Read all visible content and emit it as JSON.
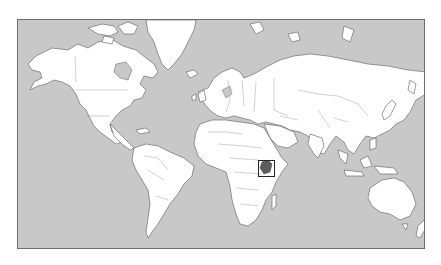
{
  "map": {
    "type": "world-locator-map",
    "projection": "Mercator",
    "highlighted_country": "Kenya",
    "colors": {
      "ocean": "#c8c8c8",
      "land": "#ffffff",
      "coastline": "#5a5a5a",
      "highlight": "#5c5c5c",
      "locator_box": "#222222",
      "frame": "#6e6e6e"
    },
    "frame": {
      "x": 17,
      "y": 19,
      "width": 408,
      "height": 230
    },
    "locator_box": {
      "x": 257,
      "y": 159,
      "width": 17,
      "height": 17
    }
  }
}
